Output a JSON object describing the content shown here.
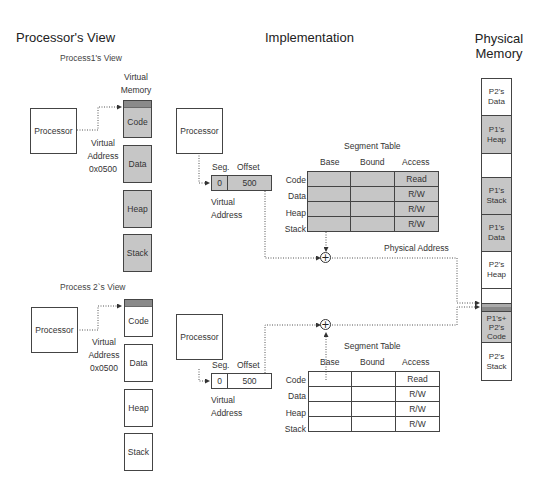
{
  "sections": {
    "processors_view": "Processor's View",
    "implementation": "Implementation",
    "physical_memory": "Physical\nMemory",
    "physical_memory_line1": "Physical",
    "physical_memory_line2": "Memory"
  },
  "process1": {
    "title": "Process1's View",
    "virtual_memory_line1": "Virtual",
    "virtual_memory_line2": "Memory",
    "processor_label": "Processor",
    "virtual_address_line1": "Virtual",
    "virtual_address_line2": "Address",
    "virtual_address_value": "0x0500",
    "segments": [
      "Code",
      "Data",
      "Heap",
      "Stack"
    ]
  },
  "process2": {
    "title": "Process 2`s View",
    "processor_label": "Processor",
    "virtual_address_line1": "Virtual",
    "virtual_address_line2": "Address",
    "virtual_address_value": "0x0500",
    "segments": [
      "Code",
      "Data",
      "Heap",
      "Stack"
    ]
  },
  "impl1": {
    "processor_label": "Processor",
    "seg_header": "Seg.",
    "offset_header": "Offset",
    "seg_value": "0",
    "offset_value": "500",
    "virtual_address_line1": "Virtual",
    "virtual_address_line2": "Address",
    "table_title": "Segment Table",
    "columns": [
      "Base",
      "Bound",
      "Access"
    ],
    "rows": [
      {
        "name": "Code",
        "base": "",
        "bound": "",
        "access": "Read"
      },
      {
        "name": "Data",
        "base": "",
        "bound": "",
        "access": "R/W"
      },
      {
        "name": "Heap",
        "base": "",
        "bound": "",
        "access": "R/W"
      },
      {
        "name": "Stack",
        "base": "",
        "bound": "",
        "access": "R/W"
      }
    ],
    "physical_address_label": "Physical Address",
    "adder_symbol": "+"
  },
  "impl2": {
    "processor_label": "Processor",
    "seg_header": "Seg.",
    "offset_header": "Offset",
    "seg_value": "0",
    "offset_value": "500",
    "virtual_address_line1": "Virtual",
    "virtual_address_line2": "Address",
    "table_title": "Segment Table",
    "columns": [
      "Base",
      "Bound",
      "Access"
    ],
    "rows": [
      {
        "name": "Code",
        "base": "",
        "bound": "",
        "access": "Read"
      },
      {
        "name": "Data",
        "base": "",
        "bound": "",
        "access": "R/W"
      },
      {
        "name": "Heap",
        "base": "",
        "bound": "",
        "access": "R/W"
      },
      {
        "name": "Stack",
        "base": "",
        "bound": "",
        "access": "R/W"
      }
    ],
    "adder_symbol": "+"
  },
  "physical_memory": {
    "blocks": [
      {
        "line1": "P2's",
        "line2": "Data",
        "line3": "",
        "shade": "white"
      },
      {
        "line1": "P1's",
        "line2": "Heap",
        "line3": "",
        "shade": "gray"
      },
      {
        "line1": "",
        "line2": "",
        "line3": "",
        "shade": "white"
      },
      {
        "line1": "P1's",
        "line2": "Stack",
        "line3": "",
        "shade": "gray"
      },
      {
        "line1": "P1's",
        "line2": "Data",
        "line3": "",
        "shade": "gray"
      },
      {
        "line1": "P2's",
        "line2": "Heap",
        "line3": "",
        "shade": "white"
      },
      {
        "line1": "",
        "line2": "",
        "line3": "",
        "shade": "white"
      },
      {
        "line1": "",
        "line2": "",
        "line3": "",
        "shade": "mid"
      },
      {
        "line1": "",
        "line2": "",
        "line3": "",
        "shade": "dark"
      },
      {
        "line1": "P1's+",
        "line2": "P2's",
        "line3": "Code",
        "shade": "gray"
      },
      {
        "line1": "P2's",
        "line2": "Stack",
        "line3": "",
        "shade": "white"
      }
    ]
  }
}
